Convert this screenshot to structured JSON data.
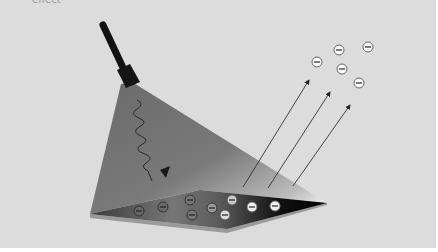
{
  "diagram": {
    "caption_fragment": "effect",
    "background": "#dcdcdc",
    "lamp": {
      "label": "light source",
      "color": "#111111"
    },
    "beam": {
      "label": "incident light",
      "color": "#6e6e6e"
    },
    "photon": {
      "label": "photon (wavy arrow)"
    },
    "plate": {
      "label": "metal plate",
      "edge_color": "#8a8a8a"
    },
    "electron_symbol": "−",
    "emitted_arrows": 3,
    "electrons_on_plate": 9,
    "electrons_emitted": 5
  }
}
